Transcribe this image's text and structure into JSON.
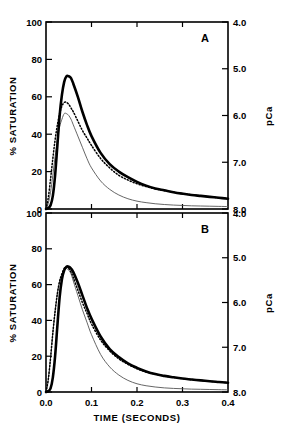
{
  "figure": {
    "panels": [
      {
        "letter": "A",
        "y_left": {
          "title": "% SATURATION",
          "ticks": [
            "100",
            "80",
            "60",
            "40",
            "20",
            "0"
          ],
          "values": [
            100,
            80,
            60,
            40,
            20,
            0
          ]
        },
        "y_right": {
          "title": "pCa",
          "ticks": [
            "4.0",
            "5.0",
            "6.0",
            "7.0",
            "8.0"
          ],
          "values": [
            4.0,
            5.0,
            6.0,
            7.0,
            8.0
          ]
        },
        "x": {
          "ticks": [
            "0.0",
            "0.1",
            "0.2",
            "0.3",
            "0.4"
          ],
          "values": [
            0.0,
            0.1,
            0.2,
            0.3,
            0.4
          ]
        }
      },
      {
        "letter": "B",
        "y_left": {
          "title": "% SATURATION",
          "ticks": [
            "100",
            "80",
            "60",
            "40",
            "20",
            "0"
          ],
          "values": [
            100,
            80,
            60,
            40,
            20,
            0
          ]
        },
        "y_right": {
          "title": "pCa",
          "ticks": [
            "4.0",
            "5.0",
            "6.0",
            "7.0",
            "8.0"
          ],
          "values": [
            4.0,
            5.0,
            6.0,
            7.0,
            8.0
          ]
        },
        "x": {
          "ticks": [
            "0.0",
            "0.1",
            "0.2",
            "0.3",
            "0.4"
          ],
          "values": [
            0.0,
            0.1,
            0.2,
            0.3,
            0.4
          ]
        }
      }
    ],
    "x_axis_label": "TIME (SECONDS)"
  },
  "chart_data": [
    {
      "type": "line",
      "title": "A",
      "xlabel": "TIME (SECONDS)",
      "ylabel": "% SATURATION",
      "y2label": "pCa",
      "xlim": [
        0.0,
        0.4
      ],
      "ylim": [
        0,
        100
      ],
      "y2lim": [
        8.0,
        4.0
      ],
      "grid": false,
      "legend": "none",
      "x": [
        0.0,
        0.005,
        0.01,
        0.015,
        0.02,
        0.025,
        0.03,
        0.035,
        0.04,
        0.045,
        0.05,
        0.055,
        0.06,
        0.07,
        0.08,
        0.09,
        0.1,
        0.12,
        0.14,
        0.16,
        0.18,
        0.2,
        0.22,
        0.24,
        0.26,
        0.28,
        0.3,
        0.32,
        0.34,
        0.36,
        0.38,
        0.4
      ],
      "series": [
        {
          "name": "thick-solid",
          "style": "solid-thick",
          "values": [
            0,
            0.5,
            2,
            7,
            18,
            34,
            50,
            61,
            68,
            71,
            71,
            70,
            67,
            60,
            52,
            45,
            39,
            30,
            24,
            20,
            17,
            14.5,
            12.5,
            11,
            10,
            9,
            8.2,
            7.5,
            7.0,
            6.5,
            6.0,
            5.5
          ]
        },
        {
          "name": "dotted",
          "style": "dotted",
          "values": [
            0,
            6,
            16,
            27,
            37,
            45,
            51,
            55,
            57,
            57,
            56,
            54,
            52,
            47,
            42,
            38,
            34,
            27,
            22,
            18,
            15.5,
            13.5,
            12,
            10.8,
            9.8,
            9.0,
            8.2,
            7.6,
            7.0,
            6.5,
            6.0,
            5.6
          ]
        },
        {
          "name": "thin-solid",
          "style": "solid-thin",
          "values": [
            0,
            3,
            9,
            18,
            28,
            37,
            44,
            48,
            51,
            51,
            50,
            48,
            45,
            39,
            33,
            27,
            22,
            15,
            10.5,
            7.5,
            5.5,
            4.2,
            3.4,
            2.8,
            2.4,
            2.1,
            1.9,
            1.7,
            1.6,
            1.5,
            1.4,
            1.3
          ]
        }
      ]
    },
    {
      "type": "line",
      "title": "B",
      "xlabel": "TIME (SECONDS)",
      "ylabel": "% SATURATION",
      "y2label": "pCa",
      "xlim": [
        0.0,
        0.4
      ],
      "ylim": [
        0,
        100
      ],
      "y2lim": [
        8.0,
        4.0
      ],
      "grid": false,
      "legend": "none",
      "x": [
        0.0,
        0.005,
        0.01,
        0.015,
        0.02,
        0.025,
        0.03,
        0.035,
        0.04,
        0.045,
        0.05,
        0.055,
        0.06,
        0.07,
        0.08,
        0.09,
        0.1,
        0.12,
        0.14,
        0.16,
        0.18,
        0.2,
        0.22,
        0.24,
        0.26,
        0.28,
        0.3,
        0.32,
        0.34,
        0.36,
        0.38,
        0.4
      ],
      "series": [
        {
          "name": "thick-solid",
          "style": "solid-thick",
          "values": [
            0,
            0.5,
            2,
            8,
            20,
            37,
            53,
            63,
            68,
            70,
            70,
            69,
            67,
            61,
            54,
            47,
            41,
            31,
            24,
            19.5,
            16,
            13.5,
            11.5,
            10,
            9,
            8.2,
            7.5,
            7.0,
            6.5,
            6.0,
            5.6,
            5.2
          ]
        },
        {
          "name": "dotted",
          "style": "dotted",
          "values": [
            0,
            7,
            19,
            33,
            45,
            55,
            62,
            66,
            69,
            70,
            69,
            67,
            64,
            57,
            50,
            44,
            38,
            29,
            23,
            18.5,
            15.5,
            13,
            11.2,
            10,
            9,
            8.2,
            7.5,
            7.0,
            6.5,
            6.0,
            5.6,
            5.2
          ]
        },
        {
          "name": "thin-solid",
          "style": "solid-thin",
          "values": [
            0,
            7,
            19,
            33,
            45,
            55,
            62,
            66,
            68,
            69,
            68,
            66,
            62,
            54,
            46,
            39,
            32,
            21,
            14,
            9.5,
            6.5,
            4.6,
            3.5,
            2.8,
            2.3,
            2.0,
            1.8,
            1.6,
            1.5,
            1.4,
            1.3,
            1.2
          ]
        }
      ]
    }
  ]
}
